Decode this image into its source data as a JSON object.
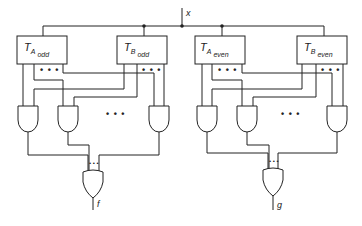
{
  "diagram": {
    "type": "logic-circuit",
    "input": {
      "label": "x"
    },
    "blocks": [
      {
        "id": "ta-odd",
        "main": "T",
        "sub": "A",
        "subsub": "odd"
      },
      {
        "id": "tb-odd",
        "main": "T",
        "sub": "B",
        "subsub": "odd"
      },
      {
        "id": "ta-even",
        "main": "T",
        "sub": "A",
        "subsub": "even"
      },
      {
        "id": "tb-even",
        "main": "T",
        "sub": "B",
        "subsub": "even"
      }
    ],
    "outputs": [
      {
        "id": "f",
        "label": "f",
        "gate": "OR"
      },
      {
        "id": "g",
        "label": "g",
        "gate": "OR"
      }
    ],
    "ellipsis": "• • •",
    "ellipsis_small": "• • •"
  }
}
